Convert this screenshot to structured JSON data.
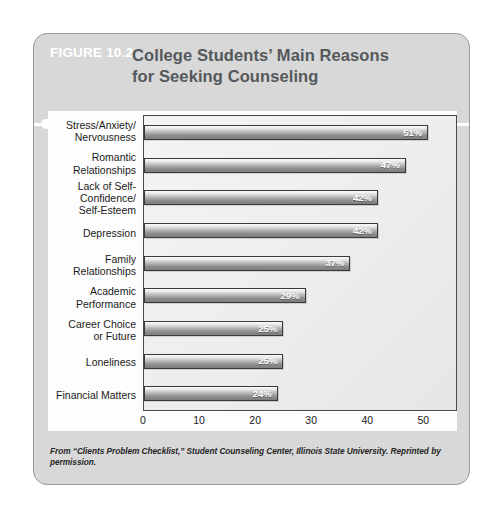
{
  "figure": {
    "number": "FIGURE 10.2",
    "title_line1": "College Students’ Main Reasons",
    "title_line2": "for Seeking Counseling",
    "source_note": "From “Clients Problem Checklist,” Student Counseling Center, Illinois State University. Reprinted by permission."
  },
  "colors": {
    "card_background": "#d8d8d8",
    "card_border": "#9a9a9a",
    "figure_number_text": "#ffffff",
    "title_text": "#55585b",
    "rule": "#ffffff",
    "panel_background": "#fdfdfd",
    "plot_background": "#ededed",
    "bar_outline": "#3a3a3a",
    "bar_gradient_light": "#fafafa",
    "bar_gradient_dark": "#7d7d7d",
    "value_label_text": "#ffffff",
    "axis_text": "#1b1b1b"
  },
  "chart_data": {
    "type": "bar",
    "orientation": "horizontal",
    "title": "College Students’ Main Reasons for Seeking Counseling",
    "xlabel": "",
    "ylabel": "",
    "xlim": [
      0,
      56
    ],
    "ticks": [
      0,
      10,
      20,
      30,
      40,
      50
    ],
    "tick_labels": [
      "0",
      "10",
      "20",
      "30",
      "40",
      "50"
    ],
    "grid": false,
    "legend": false,
    "value_suffix": "%",
    "categories": [
      "Stress/Anxiety/ Nervousness",
      "Romantic Relationships",
      "Lack of Self- Confidence/ Self-Esteem",
      "Depression",
      "Family Relationships",
      "Academic Performance",
      "Career Choice or Future",
      "Loneliness",
      "Financial Matters"
    ],
    "category_lines": [
      [
        "Stress/Anxiety/",
        "Nervousness"
      ],
      [
        "Romantic",
        "Relationships"
      ],
      [
        "Lack of Self-",
        "Confidence/",
        "Self-Esteem"
      ],
      [
        "Depression"
      ],
      [
        "Family",
        "Relationships"
      ],
      [
        "Academic",
        "Performance"
      ],
      [
        "Career Choice",
        "or Future"
      ],
      [
        "Loneliness"
      ],
      [
        "Financial Matters"
      ]
    ],
    "values": [
      51,
      47,
      42,
      42,
      37,
      29,
      25,
      25,
      24
    ],
    "value_labels": [
      "51%",
      "47%",
      "42%",
      "42%",
      "37%",
      "29%",
      "25%",
      "25%",
      "24%"
    ]
  }
}
